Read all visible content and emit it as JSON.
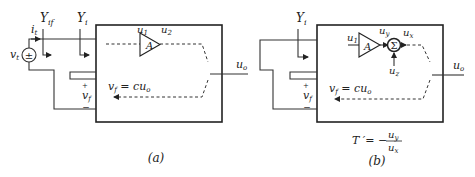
{
  "colors": {
    "line": "#333333",
    "background": "#ffffff"
  },
  "diagram_a": {
    "caption": "(a)",
    "source_label": "v",
    "source_sub": "t",
    "source_symbol": "±",
    "current_label": "i",
    "current_sub": "t",
    "admittance_if": "Y",
    "admittance_if_sub": "if",
    "admittance_i": "Y",
    "admittance_i_sub": "i",
    "amp_label": "A",
    "amp_in": "u",
    "amp_in_sub": "1",
    "amp_out": "u",
    "amp_out_sub": "2",
    "feedback_label": "v",
    "feedback_sub": "f",
    "feedback_eq": " = cu",
    "feedback_eq_sub": "o",
    "vf_plus": "+",
    "vf_minus": "−",
    "output_label": "u",
    "output_sub": "o"
  },
  "diagram_b": {
    "caption": "(b)",
    "admittance_i": "Y",
    "admittance_i_sub": "i",
    "amp_label": "A",
    "amp_in": "u",
    "amp_in_sub": "1",
    "amp_out": "u",
    "amp_out_sub": "y",
    "sum_symbol": "Σ",
    "sum_out": "u",
    "sum_out_sub": "x",
    "sum_in": "u",
    "sum_in_sub": "z",
    "feedback_label": "v",
    "feedback_sub": "f",
    "feedback_eq": " = cu",
    "feedback_eq_sub": "o",
    "vf_plus": "+",
    "vf_minus": "−",
    "output_label": "u",
    "output_sub": "o",
    "formula_lhs": "T ′= −",
    "formula_num": "u",
    "formula_num_sub": "y",
    "formula_den": "u",
    "formula_den_sub": "x"
  }
}
